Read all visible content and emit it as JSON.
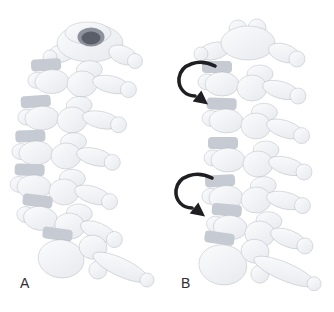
{
  "figure": {
    "panels": [
      {
        "label": "A",
        "name": "cervical-spine-view-a",
        "rotation_arrows": 0
      },
      {
        "label": "B",
        "name": "cervical-spine-view-b",
        "rotation_arrows": 2
      }
    ],
    "icons": {
      "upper_arrow": "rotation-arrow-icon",
      "lower_arrow": "rotation-arrow-icon"
    },
    "colors": {
      "background": "#ffffff",
      "bone_light": "#fbfcfd",
      "bone_mid": "#e7e9ee",
      "outline": "#9fa4b0",
      "disc": "#c6cad2",
      "foramen_outer": "#8d929d",
      "foramen_inner": "#595e69",
      "arrow": "#1f1f23",
      "label_text": "#2e2e33"
    }
  }
}
